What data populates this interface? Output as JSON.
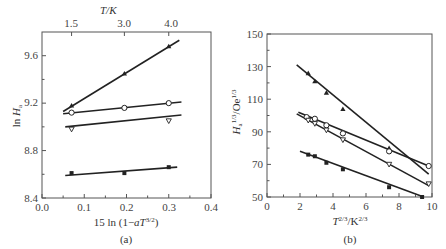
{
  "chart_data": [
    {
      "panel": "(a)",
      "type": "scatter",
      "title": "",
      "xlabel": "15 ln (1−aT^3/2)",
      "ylabel": "ln H_a",
      "top_axis_label": "T/K",
      "top_axis_ticks": [
        {
          "label": "1.5",
          "x": 0.07
        },
        {
          "label": "3.0",
          "x": 0.195
        },
        {
          "label": "4.0",
          "x": 0.3
        }
      ],
      "xlim": [
        0.0,
        0.4
      ],
      "ylim": [
        8.4,
        9.8
      ],
      "x_ticks": [
        "0.0",
        "0.1",
        "0.2",
        "0.3",
        "0.4"
      ],
      "y_ticks": [
        "8.4",
        "8.8",
        "9.2",
        "9.6"
      ],
      "grid": false,
      "series": [
        {
          "name": "series-1",
          "marker": "filled-triangle",
          "points": [
            [
              0.07,
              9.18
            ],
            [
              0.195,
              9.45
            ],
            [
              0.3,
              9.68
            ]
          ],
          "fit": [
            [
              0.05,
              9.13
            ],
            [
              0.325,
              9.73
            ]
          ]
        },
        {
          "name": "series-2",
          "marker": "open-circle",
          "points": [
            [
              0.07,
              9.12
            ],
            [
              0.195,
              9.16
            ],
            [
              0.3,
              9.2
            ]
          ],
          "fit": [
            [
              0.05,
              9.11
            ],
            [
              0.33,
              9.21
            ]
          ]
        },
        {
          "name": "series-3",
          "marker": "open-down-triangle",
          "points": [
            [
              0.07,
              8.98
            ],
            [
              0.3,
              9.05
            ]
          ],
          "fit": [
            [
              0.055,
              9.0
            ],
            [
              0.33,
              9.1
            ]
          ]
        },
        {
          "name": "series-4",
          "marker": "filled-square",
          "points": [
            [
              0.07,
              8.61
            ],
            [
              0.195,
              8.61
            ],
            [
              0.3,
              8.66
            ]
          ],
          "fit": [
            [
              0.055,
              8.59
            ],
            [
              0.32,
              8.66
            ]
          ]
        }
      ]
    },
    {
      "panel": "(b)",
      "type": "scatter",
      "title": "",
      "xlabel": "T^2/3/K^2/3",
      "ylabel": "H_a^1/3/Oe^1/3",
      "xlim": [
        0,
        10
      ],
      "ylim": [
        50,
        150
      ],
      "x_ticks": [
        "0",
        "2",
        "4",
        "6",
        "8",
        "10"
      ],
      "y_ticks": [
        "50",
        "70",
        "90",
        "110",
        "130",
        "150"
      ],
      "grid": false,
      "series": [
        {
          "name": "series-A",
          "marker": "filled-triangle",
          "points": [
            [
              2.5,
              126
            ],
            [
              2.9,
              121
            ],
            [
              3.6,
              114
            ],
            [
              4.6,
              104
            ],
            [
              7.4,
              80
            ]
          ],
          "fit": [
            [
              1.8,
              131
            ],
            [
              9.8,
              64
            ]
          ]
        },
        {
          "name": "series-B",
          "marker": "open-circle",
          "points": [
            [
              2.4,
              99
            ],
            [
              2.9,
              98
            ],
            [
              3.6,
              94
            ],
            [
              4.6,
              89
            ],
            [
              7.4,
              78
            ],
            [
              9.8,
              69
            ]
          ],
          "fit": [
            [
              1.9,
              102
            ],
            [
              9.8,
              69
            ]
          ]
        },
        {
          "name": "series-C",
          "marker": "open-down-triangle",
          "points": [
            [
              2.5,
              97
            ],
            [
              2.9,
              95
            ],
            [
              3.6,
              91
            ],
            [
              4.6,
              85
            ],
            [
              7.4,
              70
            ],
            [
              9.8,
              58
            ]
          ],
          "fit": [
            [
              1.8,
              101
            ],
            [
              9.8,
              57
            ]
          ]
        },
        {
          "name": "series-D",
          "marker": "filled-square",
          "points": [
            [
              2.5,
              76
            ],
            [
              2.9,
              75
            ],
            [
              3.6,
              71
            ],
            [
              4.6,
              67
            ],
            [
              7.4,
              56
            ],
            [
              9.4,
              50
            ]
          ],
          "fit": [
            [
              2.0,
              78
            ],
            [
              9.5,
              50
            ]
          ]
        }
      ]
    }
  ],
  "labels": {
    "a": {
      "panel": "(a)",
      "top_axis": "T/K",
      "top_ticks": [
        "1.5",
        "3.0",
        "4.0"
      ],
      "ylabel_main": "ln ",
      "ylabel_var": "H",
      "ylabel_sub": "a",
      "xlabel_prefix": "15 ln (1−",
      "xlabel_var": "aT",
      "xlabel_sup": "3/2",
      "xlabel_suffix": ")",
      "x_ticks": [
        "0.0",
        "0.1",
        "0.2",
        "0.3",
        "0.4"
      ],
      "y_ticks": [
        "8.4",
        "8.8",
        "9.2",
        "9.6"
      ]
    },
    "b": {
      "panel": "(b)",
      "ylabel_var": "H",
      "ylabel_sub": "a",
      "ylabel_sup": "1/3",
      "ylabel_unit": "/Oe",
      "ylabel_unit_sup": "1/3",
      "xlabel_var": "T",
      "xlabel_sup": "2/3",
      "xlabel_unit": "/K",
      "xlabel_unit_sup": "2/3",
      "x_ticks": [
        "0",
        "2",
        "4",
        "6",
        "8",
        "10"
      ],
      "y_ticks": [
        "50",
        "70",
        "90",
        "110",
        "130",
        "150"
      ]
    }
  }
}
